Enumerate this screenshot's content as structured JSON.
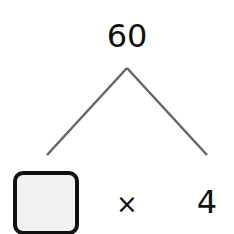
{
  "diagram": {
    "product": "60",
    "operator": "×",
    "known_factor": "4",
    "unknown_factor": "",
    "line_color": "#666666",
    "box_fill": "#f2f2f2",
    "box_border": "#111111"
  }
}
